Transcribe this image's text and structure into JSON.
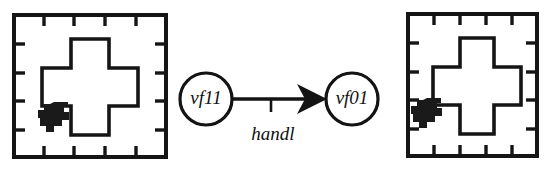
{
  "figure": {
    "background_color": "#ffffff",
    "ink_color": "#151515",
    "width": 553,
    "height": 170
  },
  "panels": [
    {
      "id": "panel-left",
      "role": "before-state",
      "frame": {
        "x": 14,
        "y": 15,
        "width": 152,
        "height": 142
      },
      "ticks_per_edge": 4,
      "tick_length": 11,
      "cross": {
        "name": "plus-shape",
        "center_x": 90,
        "center_y": 87,
        "arm_half_width": 19,
        "half_span": 48
      },
      "robot": {
        "name": "robot-marker",
        "x": 38,
        "y": 102,
        "width": 30,
        "height": 32,
        "color": "#1a1a1a"
      }
    },
    {
      "id": "panel-right",
      "role": "after-state",
      "frame": {
        "x": 408,
        "y": 14,
        "width": 129,
        "height": 142
      },
      "ticks_per_edge": 4,
      "tick_length": 11,
      "cross": {
        "name": "plus-shape",
        "center_x": 477,
        "center_y": 86,
        "arm_half_width": 19,
        "half_span": 48
      },
      "robot": {
        "name": "robot-marker",
        "x": 411,
        "y": 98,
        "width": 30,
        "height": 32,
        "color": "#1a1a1a"
      }
    }
  ],
  "graph": {
    "nodes": [
      {
        "id": "node-vf11",
        "label": "vf11",
        "cx": 206,
        "cy": 99,
        "r": 26
      },
      {
        "id": "node-vf01",
        "label": "vf01",
        "cx": 352,
        "cy": 99,
        "r": 26
      }
    ],
    "edges": [
      {
        "id": "edge-handl",
        "label": "handl",
        "from": "node-vf11",
        "to": "node-vf01",
        "x1": 232,
        "x2": 326,
        "y": 99,
        "label_x": 273,
        "label_y": 133,
        "anchor_tick_x": 271,
        "direction": "left-to-right"
      }
    ]
  }
}
